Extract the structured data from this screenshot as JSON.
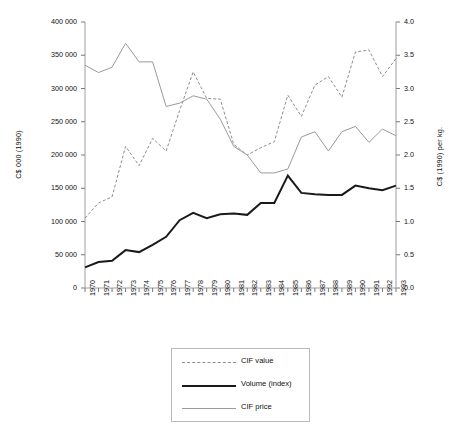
{
  "chart_data": {
    "type": "line",
    "title": "",
    "xlabel": "",
    "ylabel": "C$ 000 (1990)",
    "y2label": "C$ (1990) per kg.",
    "grid": false,
    "legend_position": "bottom",
    "x": [
      "1970",
      "1971",
      "1972",
      "1973",
      "1974",
      "1975",
      "1976",
      "1977",
      "1978",
      "1979",
      "1980",
      "1981",
      "1982",
      "1983",
      "1984",
      "1985",
      "1986",
      "1987",
      "1988",
      "1989",
      "1990",
      "1991",
      "1992",
      "1993"
    ],
    "ylim": [
      0,
      400000
    ],
    "yticks": [
      "0",
      "50 000",
      "100 000",
      "150 000",
      "200 000",
      "250 000",
      "300 000",
      "350 000",
      "400 000"
    ],
    "ytick_values": [
      0,
      50000,
      100000,
      150000,
      200000,
      250000,
      300000,
      350000,
      400000
    ],
    "y2lim": [
      0,
      4.0
    ],
    "y2ticks": [
      "0.0",
      "0.5",
      "1.0",
      "1.5",
      "2.0",
      "2.5",
      "3.0",
      "3.5",
      "4.0"
    ],
    "y2tick_values": [
      0,
      0.5,
      1.0,
      1.5,
      2.0,
      2.5,
      3.0,
      3.5,
      4.0
    ],
    "series": [
      {
        "name": "CIF value",
        "axis": "left",
        "style": "dashed",
        "color": "#8e8e8e",
        "values": [
          105000,
          128000,
          137000,
          213000,
          184000,
          225000,
          206000,
          267000,
          325000,
          285000,
          284000,
          216000,
          200000,
          211000,
          220000,
          290000,
          258000,
          305000,
          318000,
          287000,
          355000,
          358000,
          318000,
          345000
        ]
      },
      {
        "name": "Volume (index)",
        "axis": "left",
        "style": "thick-solid",
        "color": "#1a1a1a",
        "values": [
          31000,
          39000,
          41000,
          57000,
          54000,
          65000,
          77000,
          102000,
          113000,
          105000,
          111000,
          112000,
          110000,
          128000,
          128000,
          169000,
          143000,
          141000,
          140000,
          140000,
          154000,
          150000,
          147000,
          154000
        ]
      },
      {
        "name": "CIF price",
        "axis": "right",
        "style": "thin-solid",
        "color": "#9a9a9a",
        "values": [
          3.35,
          3.24,
          3.32,
          3.68,
          3.4,
          3.4,
          2.73,
          2.78,
          2.89,
          2.84,
          2.54,
          2.13,
          2.0,
          1.73,
          1.73,
          1.79,
          2.27,
          2.35,
          2.06,
          2.35,
          2.43,
          2.19,
          2.39,
          2.29
        ]
      }
    ]
  },
  "legend": {
    "items": [
      {
        "label": "CIF value"
      },
      {
        "label": "Volume (index)"
      },
      {
        "label": "CIF price"
      }
    ]
  },
  "axes": {
    "left_title": "C$ 000 (1990)",
    "right_title": "C$ (1990) per kg."
  }
}
